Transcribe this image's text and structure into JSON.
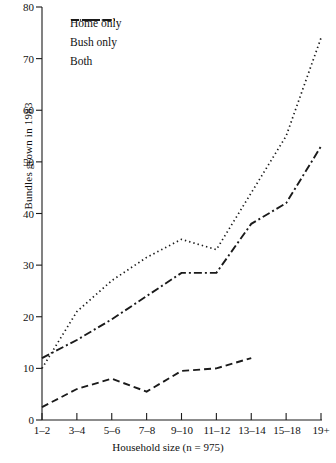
{
  "chart_data": {
    "type": "line",
    "title": "",
    "xlabel": "Household size (n = 975)",
    "ylabel": "Bundles grown in 1983",
    "categories": [
      "1–2",
      "3–4",
      "5–6",
      "7–8",
      "9–10",
      "11–12",
      "13–14",
      "15–18",
      "19+"
    ],
    "ylim": [
      0,
      80
    ],
    "yticks": [
      0,
      10,
      20,
      30,
      40,
      50,
      60,
      70,
      80
    ],
    "grid": false,
    "legend_position": "top-left",
    "series": [
      {
        "name": "Home only",
        "style": "dashed",
        "values": [
          2.5,
          6,
          8,
          5.5,
          9.5,
          10,
          12,
          null,
          null
        ]
      },
      {
        "name": "Bush only",
        "style": "dash-dot",
        "values": [
          12,
          15.5,
          19.5,
          24,
          28.5,
          28.5,
          38,
          42,
          53
        ]
      },
      {
        "name": "Both",
        "style": "dotted",
        "values": [
          10,
          21,
          27,
          31.5,
          35,
          33,
          44,
          55,
          74
        ]
      }
    ]
  },
  "axis": {
    "y_tick_labels": [
      "0",
      "10",
      "20",
      "30",
      "40",
      "50",
      "60",
      "70",
      "80"
    ],
    "x_tick_labels": [
      "1–2",
      "3–4",
      "5–6",
      "7–8",
      "9–10",
      "11–12",
      "13–14",
      "15–18",
      "19+"
    ],
    "y_axis_title": "Bundles grown in 1983",
    "x_axis_title": "Household size (n = 975)"
  },
  "legend": {
    "items": [
      {
        "label": "Home only"
      },
      {
        "label": "Bush only"
      },
      {
        "label": "Both"
      }
    ]
  },
  "colors": {
    "line": "#1a1a1a",
    "axis": "#1a1a1a",
    "background": "#ffffff"
  }
}
